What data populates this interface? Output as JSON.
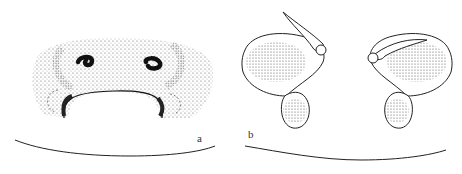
{
  "figure": {
    "panels": [
      {
        "id": "a",
        "label": "a",
        "description": "epigynum, ventral view (stippled plate with two dark copulatory openings and arched atrium)"
      },
      {
        "id": "b",
        "label": "b",
        "description": "vulva, dorsal view (paired stippled spermathecae with ducts)"
      }
    ],
    "colors": {
      "ink": "#222222",
      "stipple": "#555555",
      "background": "#ffffff"
    }
  }
}
